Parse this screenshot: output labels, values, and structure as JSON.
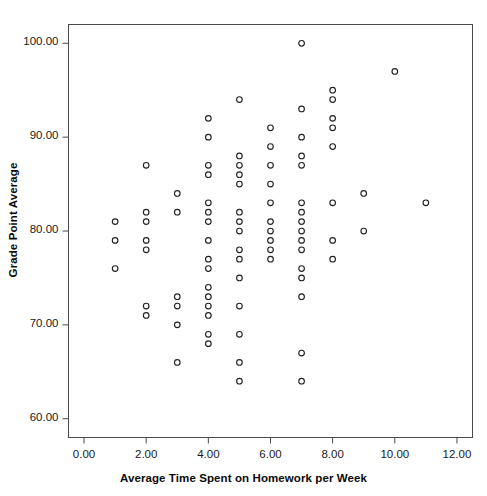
{
  "chart_data": {
    "type": "scatter",
    "title": "",
    "xlabel": "Average Time Spent on Homework per Week",
    "ylabel": "Grade Point Average",
    "xlim": [
      -0.5,
      12.5
    ],
    "ylim": [
      58.0,
      102.0
    ],
    "xticks": [
      0,
      2,
      4,
      6,
      8,
      10,
      12
    ],
    "xticklabels": [
      "0.00",
      "2.00",
      "4.00",
      "6.00",
      "8.00",
      "10.00",
      "12.00"
    ],
    "yticks": [
      60,
      70,
      80,
      90,
      100
    ],
    "yticklabels": [
      "60.00",
      "70.00",
      "80.00",
      "90.00",
      "100.00"
    ],
    "grid": false,
    "legend": null,
    "marker": "open-circle",
    "marker_color": "#222222",
    "marker_size": 5.6,
    "series": [
      {
        "name": "students",
        "points": [
          [
            1,
            81
          ],
          [
            1,
            79
          ],
          [
            1,
            76
          ],
          [
            2,
            87
          ],
          [
            2,
            82
          ],
          [
            2,
            81
          ],
          [
            2,
            79
          ],
          [
            2,
            78
          ],
          [
            2,
            72
          ],
          [
            2,
            71
          ],
          [
            3,
            84
          ],
          [
            3,
            82
          ],
          [
            3,
            73
          ],
          [
            3,
            72
          ],
          [
            3,
            70
          ],
          [
            3,
            66
          ],
          [
            4,
            92
          ],
          [
            4,
            90
          ],
          [
            4,
            87
          ],
          [
            4,
            86
          ],
          [
            4,
            83
          ],
          [
            4,
            82
          ],
          [
            4,
            81
          ],
          [
            4,
            79
          ],
          [
            4,
            77
          ],
          [
            4,
            76
          ],
          [
            4,
            74
          ],
          [
            4,
            73
          ],
          [
            4,
            72
          ],
          [
            4,
            71
          ],
          [
            4,
            69
          ],
          [
            4,
            68
          ],
          [
            5,
            94
          ],
          [
            5,
            88
          ],
          [
            5,
            87
          ],
          [
            5,
            86
          ],
          [
            5,
            85
          ],
          [
            5,
            82
          ],
          [
            5,
            81
          ],
          [
            5,
            80
          ],
          [
            5,
            78
          ],
          [
            5,
            77
          ],
          [
            5,
            75
          ],
          [
            5,
            72
          ],
          [
            5,
            69
          ],
          [
            5,
            66
          ],
          [
            5,
            64
          ],
          [
            6,
            91
          ],
          [
            6,
            89
          ],
          [
            6,
            87
          ],
          [
            6,
            85
          ],
          [
            6,
            83
          ],
          [
            6,
            81
          ],
          [
            6,
            80
          ],
          [
            6,
            79
          ],
          [
            6,
            78
          ],
          [
            6,
            77
          ],
          [
            7,
            100
          ],
          [
            7,
            93
          ],
          [
            7,
            90
          ],
          [
            7,
            88
          ],
          [
            7,
            87
          ],
          [
            7,
            83
          ],
          [
            7,
            82
          ],
          [
            7,
            81
          ],
          [
            7,
            80
          ],
          [
            7,
            79
          ],
          [
            7,
            78
          ],
          [
            7,
            76
          ],
          [
            7,
            75
          ],
          [
            7,
            73
          ],
          [
            7,
            67
          ],
          [
            7,
            64
          ],
          [
            8,
            95
          ],
          [
            8,
            94
          ],
          [
            8,
            92
          ],
          [
            8,
            91
          ],
          [
            8,
            89
          ],
          [
            8,
            83
          ],
          [
            8,
            79
          ],
          [
            8,
            77
          ],
          [
            9,
            84
          ],
          [
            9,
            80
          ],
          [
            10,
            97
          ],
          [
            11,
            83
          ]
        ]
      }
    ]
  },
  "axes": {
    "x_title": "Average Time Spent on Homework per Week",
    "y_title": "Grade Point Average"
  }
}
